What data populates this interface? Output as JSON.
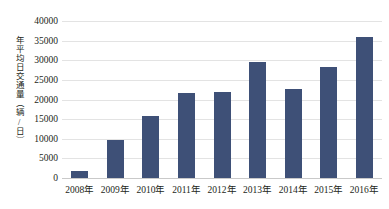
{
  "chart_data": {
    "type": "bar",
    "title": "",
    "xlabel": "",
    "ylabel": "年平均日交通量（辆/日）",
    "categories": [
      "2008年",
      "2009年",
      "2010年",
      "2011年",
      "2012年",
      "2013年",
      "2014年",
      "2015年",
      "2016年"
    ],
    "values": [
      1700,
      9600,
      15900,
      21600,
      22000,
      29500,
      22800,
      28400,
      36000
    ],
    "ylim": [
      0,
      40000
    ],
    "ytick_labels": [
      "40000",
      "35000",
      "30000",
      "25000",
      "20000",
      "15000",
      "10000",
      "5000",
      "0"
    ],
    "ytick_values": [
      40000,
      35000,
      30000,
      25000,
      20000,
      15000,
      10000,
      5000,
      0
    ],
    "grid": true,
    "legend": "none",
    "bar_color": "#3e5077",
    "gridline_color": "#e3e3e3",
    "background_color": "#ffffff",
    "text_color": "#231f20"
  }
}
